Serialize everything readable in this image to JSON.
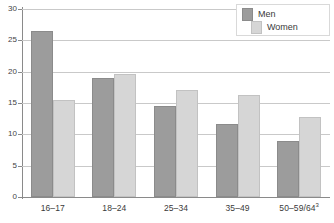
{
  "chart_data": {
    "type": "bar",
    "title": "",
    "subtitle": "",
    "xlabel": "",
    "ylabel": "",
    "ylim": [
      0,
      30
    ],
    "yticks": [
      0,
      5,
      10,
      15,
      20,
      25,
      30
    ],
    "ytick_labels": [
      "0",
      "5",
      "10",
      "15",
      "20",
      "25",
      "30"
    ],
    "grid": true,
    "legend_position": "top-right",
    "categories": [
      "16–17",
      "18–24",
      "25–34",
      "35–49",
      "50–59/64"
    ],
    "category_labels": [
      "16–17",
      "18–24",
      "25–34",
      "35–49",
      "50–59/64"
    ],
    "category_footnotes": [
      "",
      "",
      "",
      "",
      "3"
    ],
    "series": [
      {
        "name": "Men",
        "color": "#9c9c9c",
        "values": [
          26.5,
          19.0,
          14.5,
          11.7,
          9.0
        ]
      },
      {
        "name": "Women",
        "color": "#d6d6d6",
        "values": [
          15.5,
          19.6,
          17.0,
          16.3,
          12.7
        ]
      }
    ]
  },
  "legend": {
    "items": [
      {
        "label": "Men"
      },
      {
        "label": "Women"
      }
    ]
  },
  "colors": {
    "men": "#9c9c9c",
    "women": "#d6d6d6",
    "gridline": "#c9c9c9",
    "axis": "#8a8a8a",
    "text": "#3a3a3a",
    "background": "#ffffff"
  }
}
